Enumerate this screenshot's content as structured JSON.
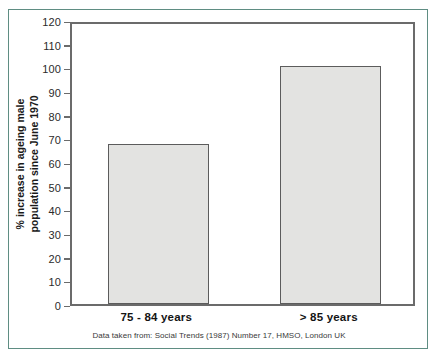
{
  "figure": {
    "caption": "Data taken from: Social Trends (1987) Number 17, HMSO, London UK",
    "frame_color": "#5f8d83",
    "bar_fill_color": "#e3e3e1",
    "bar_edge_color": "#5c5c5c",
    "axis_color": "#6b6b6b"
  },
  "chart_data": {
    "type": "bar",
    "title": "",
    "xlabel": "",
    "ylabel": "% increase in ageing male population since June 1970",
    "ylabel_line1": "% increase in ageing male",
    "ylabel_line2": "population since June 1970",
    "categories": [
      "75 - 84 years",
      "> 85 years"
    ],
    "values": [
      67.5,
      100.5
    ],
    "ylim": [
      0,
      120
    ],
    "ytick_values": [
      0,
      10,
      20,
      30,
      40,
      50,
      60,
      70,
      80,
      90,
      100,
      110,
      120
    ],
    "ytick_labels": [
      "0",
      "10",
      "20",
      "30",
      "40",
      "50",
      "60",
      "70",
      "80",
      "90",
      "100",
      "110",
      "120"
    ],
    "grid": false,
    "legend": false,
    "legend_position": "none",
    "annotations": [
      "Data taken from: Social Trends (1987) Number 17, HMSO, London UK"
    ]
  }
}
